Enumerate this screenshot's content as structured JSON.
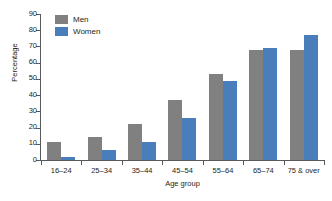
{
  "chart_data": {
    "type": "bar",
    "title": "",
    "xlabel": "Age group",
    "ylabel": "Percentage",
    "categories": [
      "16–24",
      "25–34",
      "35–44",
      "45–54",
      "55–64",
      "65–74",
      "75 & over"
    ],
    "series": [
      {
        "name": "Men",
        "color": "#808080",
        "values": [
          11,
          14,
          22,
          37,
          53,
          68,
          68
        ]
      },
      {
        "name": "Women",
        "color": "#4a7ebb",
        "values": [
          2,
          6,
          11,
          26,
          49,
          69,
          77
        ]
      }
    ],
    "ylim": [
      0,
      90
    ],
    "ytick_step": 10,
    "ytick_labels": [
      "0",
      "10",
      "20",
      "30",
      "40",
      "50",
      "60",
      "70",
      "80",
      "90"
    ],
    "grid": false,
    "legend_position": "top-left"
  }
}
